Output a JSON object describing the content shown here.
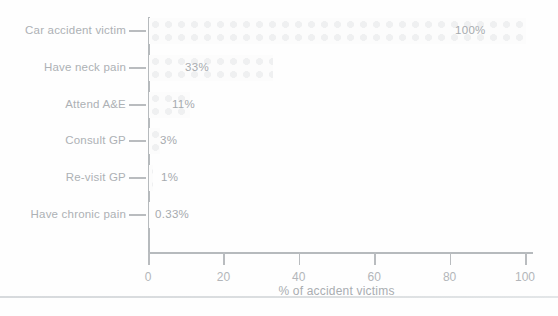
{
  "figure": {
    "kind": "scanned textbook horizontal bar chart",
    "background": "#fefefe"
  },
  "chart_data": {
    "type": "bar",
    "orientation": "horizontal",
    "title": "",
    "xlabel": "% of accident victims",
    "ylabel": "",
    "categories": [
      "Car accident victim",
      "Have neck pain",
      "Attend A&E",
      "Consult GP",
      "Re-visit GP",
      "Have chronic pain"
    ],
    "values": [
      100,
      33,
      11,
      3,
      1,
      0.33
    ],
    "value_labels": [
      "100%",
      "33%",
      "11%",
      "3%",
      "1%",
      "0.33%"
    ],
    "x_ticks": [
      0,
      20,
      40,
      60,
      80,
      100
    ],
    "x_tick_labels": [
      "0",
      "20",
      "40",
      "60",
      "80",
      "100"
    ],
    "xlim": [
      0,
      100
    ],
    "grid": false,
    "legend": null,
    "layout": {
      "plot_left_px": 148,
      "plot_right_px": 525,
      "first_row_center_y_px": 31,
      "row_spacing_px": 36.8,
      "bar_height_px": 26,
      "axis_baseline_y_px": 252,
      "y_axis_top_px": 17,
      "x_axis_overhang_px": 8,
      "value_label_x_px": [
        455,
        185,
        172,
        160,
        161,
        155
      ]
    },
    "colors": {
      "axis_line": "#b6babd",
      "category_text": "#adb1b5",
      "value_text": "#a6aaae",
      "tick_text": "#b3b6ba",
      "bar_pattern_block": "#eff0f1",
      "bottom_separator": "#d9dcde"
    }
  }
}
